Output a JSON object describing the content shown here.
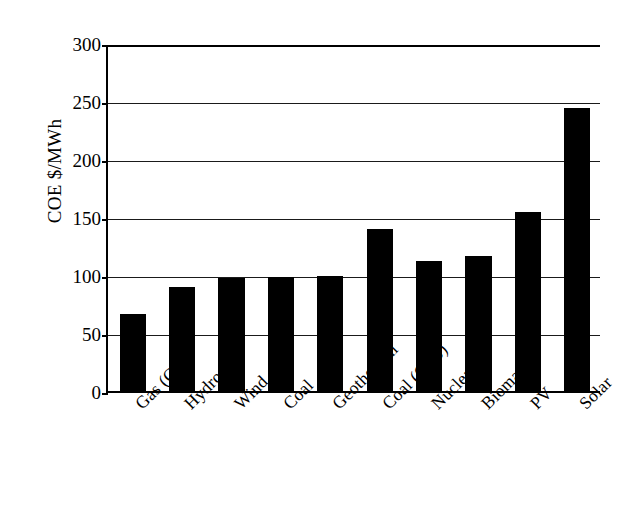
{
  "chart_data": {
    "type": "bar",
    "title": "",
    "xlabel": "",
    "ylabel": "COE $/MWh",
    "ylim": [
      0,
      300
    ],
    "ytick_labels": [
      "0",
      "50",
      "100",
      "150",
      "200",
      "250",
      "300"
    ],
    "ytick_values": [
      0,
      50,
      100,
      150,
      200,
      250,
      300
    ],
    "grid": "horizontal",
    "legend": "none",
    "bar_color": "#000000",
    "categories": [
      "Gas (CC)",
      "Hydro",
      "Wind",
      "Coal",
      "Geothermal",
      "Coal (CCS)",
      "Nuclear",
      "Biomass",
      "PV",
      "Solar"
    ],
    "values": [
      66,
      90,
      97,
      98,
      99,
      140,
      112,
      116,
      154,
      244
    ]
  }
}
